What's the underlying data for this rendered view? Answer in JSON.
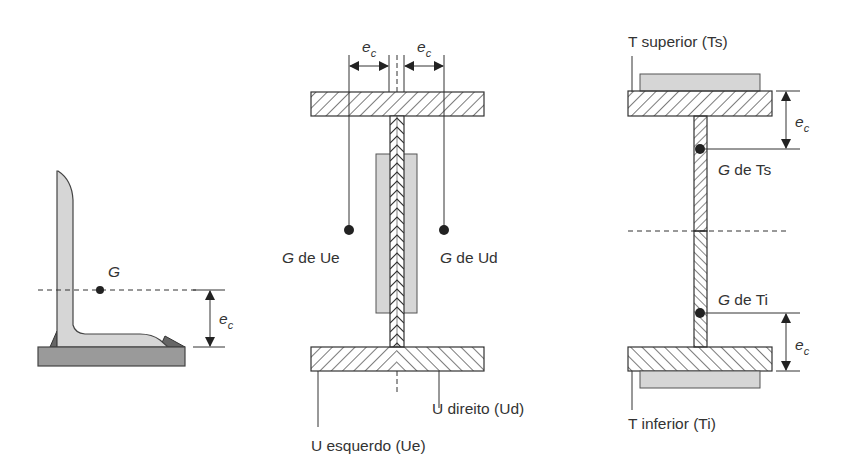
{
  "figure": {
    "colors": {
      "stroke": "#333333",
      "fill_gray_light": "#d6d6d6",
      "fill_gray_dark": "#9a9a9a",
      "background": "#ffffff"
    },
    "left_panel": {
      "centroid_label": "G",
      "dimension_label_main": "e",
      "dimension_label_sub": "c"
    },
    "middle_panel": {
      "dimension_left_main": "e",
      "dimension_left_sub": "c",
      "dimension_right_main": "e",
      "dimension_right_sub": "c",
      "centroid_left_G": "G",
      "centroid_left_rest": " de Ue",
      "centroid_right_G": "G",
      "centroid_right_rest": " de Ud",
      "label_left_channel": "U esquerdo (Ue)",
      "label_right_channel": "U direito (Ud)"
    },
    "right_panel": {
      "label_top_tee": "T superior (Ts)",
      "label_bottom_tee": "T inferior (Ti)",
      "centroid_top_G": "G",
      "centroid_top_rest": " de Ts",
      "centroid_bottom_G": "G",
      "centroid_bottom_rest": " de Ti",
      "dimension_top_main": "e",
      "dimension_top_sub": "c",
      "dimension_bottom_main": "e",
      "dimension_bottom_sub": "c"
    }
  }
}
